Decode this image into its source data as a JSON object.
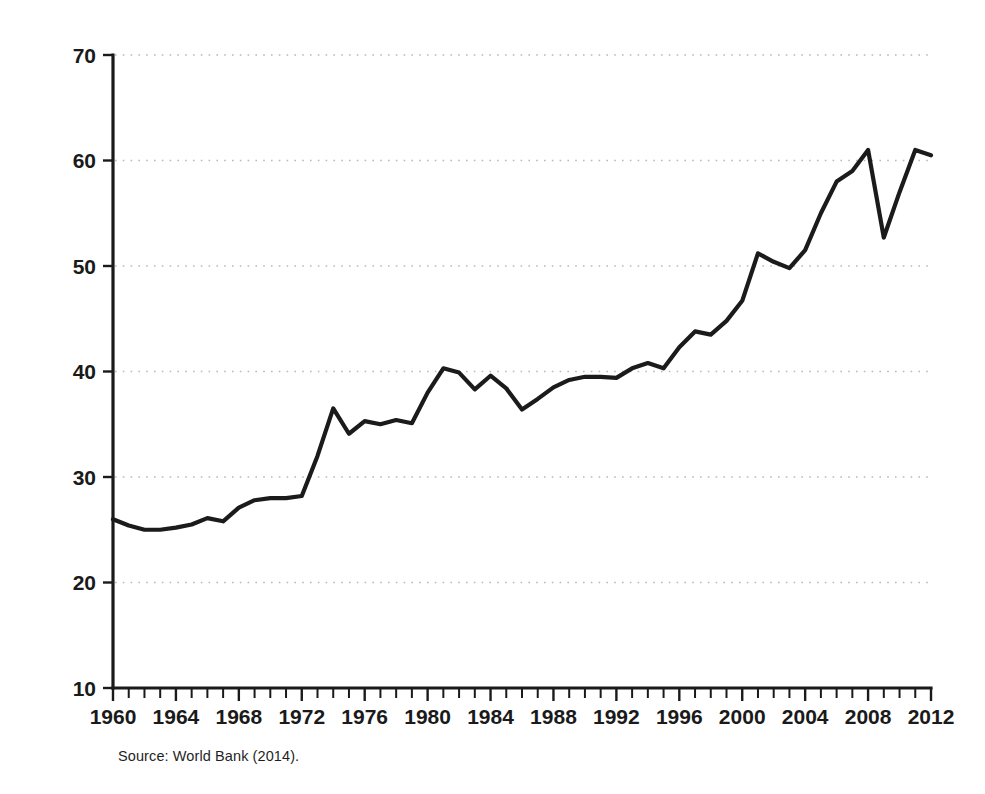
{
  "figure": {
    "source_note": "Source: World Bank (2014)."
  },
  "chart_data": {
    "type": "line",
    "title": "",
    "subtitle": "",
    "xlabel": "",
    "ylabel": "Percentage of GDP",
    "xlim": [
      1960,
      2012
    ],
    "ylim": [
      10,
      70
    ],
    "ytick_values": [
      10,
      20,
      30,
      40,
      50,
      60,
      70
    ],
    "ytick_labels": [
      "10",
      "20",
      "30",
      "40",
      "50",
      "60",
      "70"
    ],
    "ytick_step": 10,
    "xtick_values": [
      1960,
      1964,
      1968,
      1972,
      1976,
      1980,
      1984,
      1988,
      1992,
      1996,
      2000,
      2004,
      2008,
      2012
    ],
    "xtick_labels": [
      "1960",
      "1964",
      "1968",
      "1972",
      "1976",
      "1980",
      "1984",
      "1988",
      "1992",
      "1996",
      "2000",
      "2004",
      "2008",
      "2012"
    ],
    "xtick_minor_step": 1,
    "grid": "horizontal-dotted",
    "legend": "none",
    "series": [
      {
        "name": "Trade (percentage of GDP)",
        "color": "#1b1b1b",
        "x": [
          1960,
          1961,
          1962,
          1963,
          1964,
          1965,
          1966,
          1967,
          1968,
          1969,
          1970,
          1971,
          1972,
          1973,
          1974,
          1975,
          1976,
          1977,
          1978,
          1979,
          1980,
          1981,
          1982,
          1983,
          1984,
          1985,
          1986,
          1987,
          1988,
          1989,
          1990,
          1991,
          1992,
          1993,
          1994,
          1995,
          1996,
          1997,
          1998,
          1999,
          2000,
          2001,
          2002,
          2003,
          2004,
          2005,
          2006,
          2007,
          2008,
          2009,
          2010,
          2011,
          2012
        ],
        "values": [
          26.0,
          25.4,
          25.0,
          25.0,
          25.2,
          25.5,
          26.1,
          25.8,
          27.1,
          27.8,
          28.0,
          28.0,
          28.2,
          32.0,
          36.5,
          34.1,
          35.3,
          35.0,
          35.4,
          35.1,
          38.0,
          40.3,
          39.9,
          38.3,
          39.6,
          38.4,
          36.4,
          37.4,
          38.5,
          39.2,
          39.5,
          39.5,
          39.4,
          40.3,
          40.8,
          40.3,
          42.3,
          43.8,
          43.5,
          44.8,
          46.7,
          51.2,
          50.4,
          49.8,
          51.5,
          55.0,
          58.0,
          59.0,
          61.0,
          52.7,
          57.0,
          61.0,
          60.5
        ]
      }
    ]
  }
}
